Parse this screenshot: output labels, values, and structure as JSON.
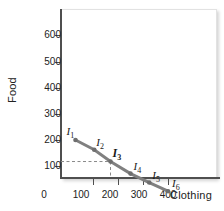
{
  "chart_data": {
    "type": "line",
    "title": "",
    "xlabel": "Clothing",
    "ylabel": "Food",
    "xlim": [
      0,
      480
    ],
    "ylim": [
      0,
      670
    ],
    "grid": false,
    "legend": "none",
    "xticks": [
      0,
      100,
      200,
      300,
      400
    ],
    "xtick_labels": [
      "0",
      "100",
      "200",
      "300",
      "400"
    ],
    "yticks": [
      100,
      200,
      300,
      400,
      500,
      600
    ],
    "ytick_labels": [
      "100",
      "200",
      "300",
      "400",
      "500",
      "600"
    ],
    "series": [
      {
        "name": "budget-line",
        "color": "#808080",
        "x": [
          30,
          105,
          170,
          250,
          325,
          400
        ],
        "y": [
          200,
          163,
          118,
          72,
          38,
          5
        ]
      }
    ],
    "point_labels": [
      {
        "text": "I",
        "sub": "1",
        "emphasis": false
      },
      {
        "text": "I",
        "sub": "2",
        "emphasis": false
      },
      {
        "text": "I",
        "sub": "3",
        "emphasis": true
      },
      {
        "text": "I",
        "sub": "4",
        "emphasis": false
      },
      {
        "text": "I",
        "sub": "5",
        "emphasis": false
      },
      {
        "text": "I",
        "sub": "6",
        "emphasis": false
      }
    ],
    "annotations": [
      {
        "name": "guide-lines",
        "target_point": "I3",
        "x_value": 170,
        "y_value": 118,
        "style": "dashed"
      }
    ],
    "colors": {
      "line": "#808080",
      "marker": "#6e6e6e",
      "axis": "#4f4f4f",
      "guide": "#8a8a8a",
      "text": "#222222"
    }
  }
}
